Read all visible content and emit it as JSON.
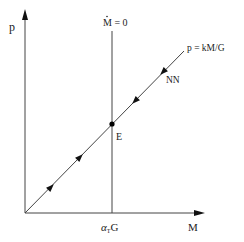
{
  "diagram": {
    "type": "phase-diagram",
    "axes": {
      "y_label": "p",
      "x_label": "M"
    },
    "vertical_line": {
      "label_base": "M",
      "label_rest": " = 0",
      "dot_over_label": true,
      "x_value_label_alpha": "α",
      "x_value_label_sub": "T",
      "x_value_label_rest": "G"
    },
    "diagonal_line": {
      "label": "p = kM/G",
      "path_label": "NN"
    },
    "equilibrium_point": {
      "label": "E"
    },
    "colors": {
      "line": "#333333",
      "text": "#222222",
      "background": "#ffffff"
    }
  }
}
